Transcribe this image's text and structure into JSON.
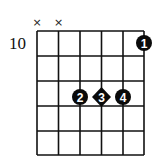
{
  "diagram": {
    "type": "guitar-chord-diagram",
    "start_fret_label": "10",
    "strings": 6,
    "frets_shown": 5,
    "mute_symbol": "×",
    "muted_strings": [
      1,
      2
    ],
    "fingers": [
      {
        "finger": "1",
        "string": 6,
        "fret_row": 1,
        "shape": "circle"
      },
      {
        "finger": "2",
        "string": 3,
        "fret_row": 3,
        "shape": "circle"
      },
      {
        "finger": "3",
        "string": 4,
        "fret_row": 3,
        "shape": "diamond"
      },
      {
        "finger": "4",
        "string": 5,
        "fret_row": 3,
        "shape": "circle"
      }
    ],
    "colors": {
      "grid": "#111111",
      "dot": "#0a0a0a",
      "dot_text": "#ffffff",
      "background": "#ffffff"
    }
  }
}
